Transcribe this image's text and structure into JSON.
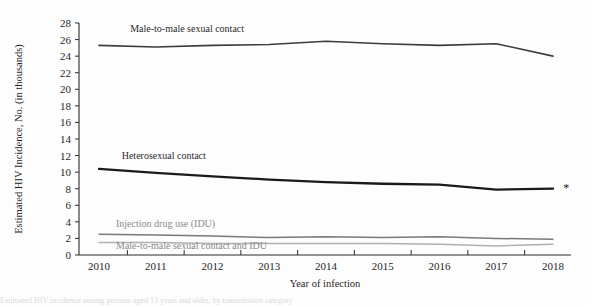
{
  "figure": {
    "background": "#fdfdfd",
    "footnote_marker": "*",
    "caption_fragment": "Estimated HIV incidence among persons aged 13 years and older, by transmission category"
  },
  "chart_data": {
    "type": "line",
    "title": "",
    "xlabel": "Year of infection",
    "ylabel": "Estimated HIV Incidence, No. (in thousands)",
    "x": [
      2010,
      2011,
      2012,
      2013,
      2014,
      2015,
      2016,
      2017,
      2018
    ],
    "categories": [
      "2010",
      "2011",
      "2012",
      "2013",
      "2014",
      "2015",
      "2016",
      "2017",
      "2018"
    ],
    "xlim": [
      2010,
      2018
    ],
    "ylim": [
      0,
      28
    ],
    "yticks": [
      0,
      2,
      4,
      6,
      8,
      10,
      12,
      14,
      16,
      18,
      20,
      22,
      24,
      26,
      28
    ],
    "ytick_labels": [
      "0",
      "2",
      "4",
      "6",
      "8",
      "10",
      "12",
      "14",
      "16",
      "18",
      "20",
      "22",
      "24",
      "26",
      "28"
    ],
    "grid": false,
    "legend_position": "inline-labels",
    "series": [
      {
        "name": "Male-to-male sexual contact",
        "color": "#3c3c3c",
        "width": 1.6,
        "label_x": 2010.55,
        "label_y": 26.9,
        "values": [
          25.3,
          25.1,
          25.3,
          25.4,
          25.8,
          25.5,
          25.3,
          25.5,
          24.0
        ]
      },
      {
        "name": "Heterosexual contact",
        "color": "#1a1a1a",
        "width": 2.3,
        "label_x": 2010.4,
        "label_y": 11.6,
        "values": [
          10.4,
          9.9,
          9.5,
          9.1,
          8.8,
          8.6,
          8.5,
          7.9,
          8.0
        ]
      },
      {
        "name": "Injection drug use (IDU)",
        "color": "#7a7a7a",
        "width": 1.5,
        "label_x": 2010.3,
        "label_y": 3.4,
        "values": [
          2.5,
          2.4,
          2.3,
          2.1,
          2.2,
          2.1,
          2.2,
          2.0,
          1.9
        ]
      },
      {
        "name": "Male-to-male sexual contact and IDU",
        "color": "#b0b0b0",
        "width": 1.5,
        "label_x": 2010.3,
        "label_y": 0.75,
        "values": [
          1.5,
          1.5,
          1.4,
          1.4,
          1.4,
          1.4,
          1.3,
          1.1,
          1.3
        ]
      }
    ],
    "annotations": [
      {
        "text": "*",
        "x": 2018.18,
        "y": 8.0
      }
    ]
  }
}
